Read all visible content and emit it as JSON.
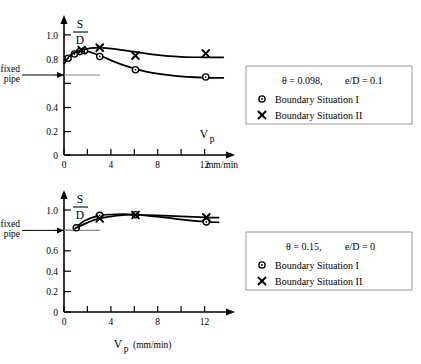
{
  "figure": {
    "panels": [
      "top",
      "bottom"
    ]
  },
  "chart_data": [
    {
      "type": "scatter",
      "panel": "top",
      "title": "",
      "xlabel": "V_p",
      "xunits": "mm/min",
      "ylabel": "S/D",
      "ylabel_numerator": "S",
      "ylabel_denominator": "D",
      "xlim": [
        0,
        14
      ],
      "ylim": [
        0,
        1.1
      ],
      "xticks": [
        0,
        2,
        4,
        6,
        8,
        10,
        12
      ],
      "xticklabels": [
        "0",
        "",
        "4",
        "",
        "8",
        "",
        "12"
      ],
      "yticks": [
        0,
        0.2,
        0.4,
        0.6,
        0.8,
        1.0
      ],
      "yticklabels": [
        "0",
        "0.2",
        "0.4",
        "0.6",
        "",
        "1.0"
      ],
      "grid": false,
      "reference_line": {
        "label": "fixed pipe",
        "value": 0.67
      },
      "conditions": {
        "theta": "θ = 0.098,",
        "eD": "e/D = 0.1"
      },
      "series": [
        {
          "name": "Boundary Situation I",
          "marker": "circle",
          "points": [
            {
              "x": 0.35,
              "y": 0.8
            },
            {
              "x": 0.9,
              "y": 0.835
            },
            {
              "x": 1.35,
              "y": 0.855
            },
            {
              "x": 1.75,
              "y": 0.862
            },
            {
              "x": 3.05,
              "y": 0.815
            },
            {
              "x": 6.1,
              "y": 0.705
            },
            {
              "x": 12.1,
              "y": 0.645
            }
          ],
          "curve": [
            {
              "x": 0.0,
              "y": 0.755
            },
            {
              "x": 0.5,
              "y": 0.815
            },
            {
              "x": 1.2,
              "y": 0.853
            },
            {
              "x": 1.8,
              "y": 0.862
            },
            {
              "x": 3.0,
              "y": 0.825
            },
            {
              "x": 5.0,
              "y": 0.745
            },
            {
              "x": 7.0,
              "y": 0.69
            },
            {
              "x": 9.5,
              "y": 0.655
            },
            {
              "x": 12.0,
              "y": 0.64
            },
            {
              "x": 13.6,
              "y": 0.638
            }
          ]
        },
        {
          "name": "Boundary Situation II",
          "marker": "cross",
          "points": [
            {
              "x": 1.5,
              "y": 0.868
            },
            {
              "x": 3.05,
              "y": 0.888
            },
            {
              "x": 6.1,
              "y": 0.822
            },
            {
              "x": 12.1,
              "y": 0.84
            }
          ],
          "curve": [
            {
              "x": 0.0,
              "y": 0.755
            },
            {
              "x": 0.6,
              "y": 0.83
            },
            {
              "x": 1.5,
              "y": 0.868
            },
            {
              "x": 3.0,
              "y": 0.888
            },
            {
              "x": 5.0,
              "y": 0.868
            },
            {
              "x": 7.5,
              "y": 0.832
            },
            {
              "x": 10.0,
              "y": 0.812
            },
            {
              "x": 12.0,
              "y": 0.808
            },
            {
              "x": 13.6,
              "y": 0.808
            }
          ]
        }
      ]
    },
    {
      "type": "scatter",
      "panel": "bottom",
      "title": "",
      "xlabel": "V_p",
      "xunits": "(mm/min)",
      "ylabel": "S/D",
      "ylabel_numerator": "S",
      "ylabel_denominator": "D",
      "xlim": [
        0,
        14
      ],
      "ylim": [
        0,
        1.1
      ],
      "xticks": [
        0,
        2,
        4,
        6,
        8,
        10,
        12
      ],
      "xticklabels": [
        "0",
        "",
        "4",
        "",
        "8",
        "",
        "12"
      ],
      "yticks": [
        0,
        0.2,
        0.4,
        0.6,
        0.8,
        1.0
      ],
      "yticklabels": [
        "0",
        "0.2",
        "0.4",
        "0.6",
        "",
        "1.0"
      ],
      "grid": false,
      "reference_line": {
        "label": "fixed pipe",
        "value": 0.8
      },
      "conditions": {
        "theta": "θ = 0.15,",
        "eD": "e/D = 0"
      },
      "series": [
        {
          "name": "Boundary Situation I",
          "marker": "circle",
          "points": [
            {
              "x": 1.05,
              "y": 0.805
            },
            {
              "x": 3.05,
              "y": 0.925
            },
            {
              "x": 6.1,
              "y": 0.93
            },
            {
              "x": 12.15,
              "y": 0.862
            }
          ],
          "curve": [
            {
              "x": 0.9,
              "y": 0.8
            },
            {
              "x": 1.8,
              "y": 0.875
            },
            {
              "x": 3.0,
              "y": 0.922
            },
            {
              "x": 4.5,
              "y": 0.935
            },
            {
              "x": 6.1,
              "y": 0.932
            },
            {
              "x": 8.5,
              "y": 0.905
            },
            {
              "x": 10.5,
              "y": 0.878
            },
            {
              "x": 12.1,
              "y": 0.862
            },
            {
              "x": 13.2,
              "y": 0.858
            }
          ]
        },
        {
          "name": "Boundary Situation II",
          "marker": "cross",
          "points": [
            {
              "x": 3.05,
              "y": 0.895
            },
            {
              "x": 6.1,
              "y": 0.928
            },
            {
              "x": 12.15,
              "y": 0.905
            }
          ],
          "curve": [
            {
              "x": 0.95,
              "y": 0.8
            },
            {
              "x": 2.0,
              "y": 0.855
            },
            {
              "x": 3.05,
              "y": 0.895
            },
            {
              "x": 4.5,
              "y": 0.922
            },
            {
              "x": 6.1,
              "y": 0.93
            },
            {
              "x": 8.5,
              "y": 0.922
            },
            {
              "x": 10.5,
              "y": 0.912
            },
            {
              "x": 12.1,
              "y": 0.905
            },
            {
              "x": 13.2,
              "y": 0.902
            }
          ]
        }
      ]
    }
  ],
  "legends": {
    "top": {
      "condition_theta": "θ = 0.098,",
      "condition_eD": "e/D = 0.1",
      "entry_circle": "Boundary Situation I",
      "entry_cross": "Boundary Situation II"
    },
    "bottom": {
      "condition_theta": "θ = 0.15,",
      "condition_eD": "e/D = 0",
      "entry_circle": "Boundary Situation I",
      "entry_cross": "Boundary Situation II"
    }
  },
  "labels": {
    "fixed_pipe_line1": "fixed",
    "fixed_pipe_line2": "pipe",
    "s_numerator": "S",
    "d_denominator": "D",
    "vp_base": "V",
    "vp_sub": "p",
    "top_units": "mm/min",
    "bottom_units": "(mm/min)",
    "y_1_0": "1.0",
    "y_0_8": "0.8",
    "y_0_6": "0.6",
    "y_0_4": "0.4",
    "y_0_2": "0.2",
    "y_0": "0",
    "x_0": "0",
    "x_4": "4",
    "x_8": "8",
    "x_12": "12"
  },
  "colors": {
    "ink": "#000000",
    "reference_line": "#8a8a8a",
    "legend_border": "#9a9a9a",
    "background": "#ffffff"
  }
}
